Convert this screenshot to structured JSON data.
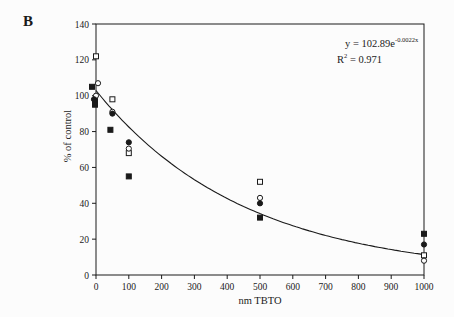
{
  "chart_data": {
    "type": "scatter",
    "panel_label": "B",
    "title": "",
    "xlabel": "nm TBTO",
    "ylabel": "% of control",
    "xlim": [
      0,
      1000
    ],
    "ylim": [
      0,
      140
    ],
    "xticks": [
      0,
      100,
      200,
      300,
      400,
      500,
      600,
      700,
      800,
      900,
      1000
    ],
    "yticks": [
      0,
      20,
      40,
      60,
      80,
      100,
      120,
      140
    ],
    "grid": false,
    "legend": "none",
    "frame": "box",
    "colors": {
      "ink": "#1a1a1a",
      "background": "#fcfcfc"
    },
    "annotation": {
      "eq_base": "y = 102.89e",
      "eq_exp": "-0.0022x",
      "r2_base": "R",
      "r2_sup": "2",
      "r2_rest": " = 0.971"
    },
    "fit": {
      "type": "exponential",
      "a": 102.89,
      "b": -0.0022,
      "x_range": [
        0,
        1000
      ],
      "r_squared": 0.971
    },
    "series": [
      {
        "name": "open-square",
        "marker": "square-open",
        "points": [
          [
            0,
            122
          ],
          [
            50,
            98
          ],
          [
            100,
            68
          ],
          [
            500,
            52
          ],
          [
            1000,
            11
          ]
        ]
      },
      {
        "name": "open-circle",
        "marker": "circle-open",
        "points": [
          [
            0,
            107,
            2
          ],
          [
            0,
            100
          ],
          [
            50,
            91
          ],
          [
            100,
            70.5
          ],
          [
            500,
            43
          ],
          [
            1000,
            8
          ]
        ]
      },
      {
        "name": "filled-circle",
        "marker": "circle-filled",
        "points": [
          [
            0,
            98,
            -2
          ],
          [
            50,
            90
          ],
          [
            100,
            74
          ],
          [
            500,
            40
          ],
          [
            1000,
            17
          ]
        ]
      },
      {
        "name": "filled-square",
        "marker": "square-filled",
        "points": [
          [
            0,
            105,
            -4
          ],
          [
            0,
            97,
            -1
          ],
          [
            0,
            95,
            -1
          ],
          [
            50,
            81,
            -2
          ],
          [
            100,
            55
          ],
          [
            500,
            32
          ],
          [
            1000,
            23
          ]
        ]
      }
    ]
  }
}
